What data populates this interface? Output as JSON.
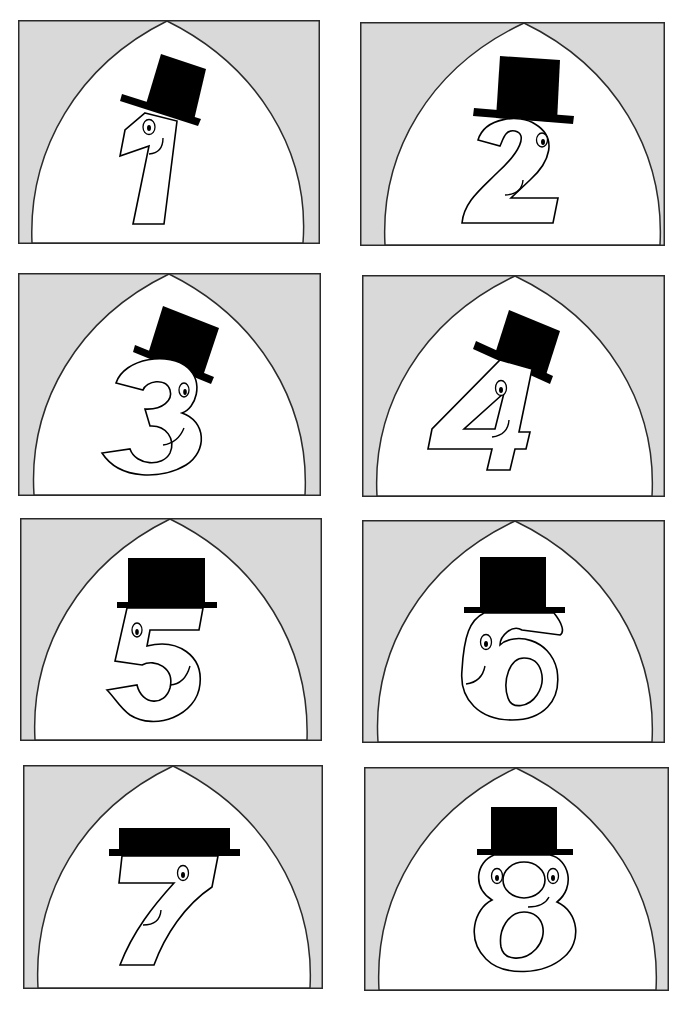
{
  "sheet": {
    "title": "Number Top-Hat Cards",
    "colors": {
      "background": "#ffffff",
      "card_fill": "#d9d9d9",
      "arch_fill": "#ffffff",
      "stroke": "#2a2a2a",
      "hat": "#000000"
    }
  },
  "cards": [
    {
      "digit": "1",
      "label": "Number 1 with top hat",
      "hat": "tilted-right"
    },
    {
      "digit": "2",
      "label": "Number 2 with top hat",
      "hat": "tilted-slight"
    },
    {
      "digit": "3",
      "label": "Number 3 with top hat",
      "hat": "tilted-right"
    },
    {
      "digit": "4",
      "label": "Number 4 with top hat",
      "hat": "tilted-right"
    },
    {
      "digit": "5",
      "label": "Number 5 with top hat",
      "hat": "straight"
    },
    {
      "digit": "6",
      "label": "Number 6 with top hat",
      "hat": "straight"
    },
    {
      "digit": "7",
      "label": "Number 7 with top hat",
      "hat": "straight-flat"
    },
    {
      "digit": "8",
      "label": "Number 8 with top hat",
      "hat": "straight"
    }
  ]
}
